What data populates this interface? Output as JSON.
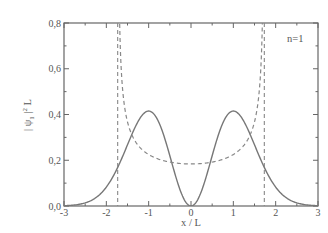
{
  "chart_data": {
    "type": "line",
    "title": "",
    "xlabel": "x / L",
    "ylabel": "| ψ₁ |² L",
    "xlim": [
      -3,
      3
    ],
    "ylim": [
      0.0,
      0.8
    ],
    "x_ticks": [
      -3,
      -2,
      -1,
      0,
      1,
      2,
      3
    ],
    "x_tick_labels": [
      "-3",
      "-2",
      "-1",
      "0",
      "1",
      "2",
      "3"
    ],
    "y_ticks": [
      0.0,
      0.2,
      0.4,
      0.6,
      0.8
    ],
    "y_tick_labels": [
      "0,0",
      "0,2",
      "0,4",
      "0,6",
      "0,8"
    ],
    "grid": false,
    "legend": null,
    "annotations": [
      {
        "text": "n=1",
        "x": 2.5,
        "y": 0.73
      }
    ],
    "series": [
      {
        "name": "quantum probability density |psi_1|^2 (n=1)",
        "style": "solid",
        "color": "#777777",
        "x": [
          -3.0,
          -2.5,
          -2.0,
          -1.5,
          -1.25,
          -1.0,
          -0.75,
          -0.5,
          -0.25,
          0.0,
          0.25,
          0.5,
          0.75,
          1.0,
          1.25,
          1.5,
          2.0,
          2.5,
          3.0
        ],
        "y": [
          0.0025,
          0.0136,
          0.0827,
          0.2669,
          0.3697,
          0.4151,
          0.3604,
          0.2197,
          0.0661,
          0.0,
          0.0661,
          0.2197,
          0.3604,
          0.4151,
          0.3697,
          0.2669,
          0.0827,
          0.0136,
          0.0025
        ]
      },
      {
        "name": "classical probability density (E = 3/2)",
        "style": "dashed",
        "color": "#888888",
        "x": [
          -1.73,
          -1.7,
          -1.6,
          -1.5,
          -1.25,
          -1.0,
          -0.5,
          0.0,
          0.5,
          1.0,
          1.25,
          1.5,
          1.6,
          1.7,
          1.73
        ],
        "y": [
          0.8,
          0.99,
          0.48,
          0.367,
          0.266,
          0.225,
          0.193,
          0.184,
          0.193,
          0.225,
          0.266,
          0.367,
          0.48,
          0.99,
          0.8
        ]
      }
    ],
    "vertical_lines": [
      {
        "x": -1.732,
        "style": "dashed",
        "label": "classical turning point"
      },
      {
        "x": 1.732,
        "style": "dashed",
        "label": "classical turning point"
      }
    ]
  },
  "labels": {
    "xlabel": "x / L",
    "ylabel_main": "| ψ",
    "ylabel_sub": "1",
    "ylabel_tail": " |",
    "ylabel_sup": "2",
    "ylabel_end": " L",
    "annotation": "n=1"
  }
}
